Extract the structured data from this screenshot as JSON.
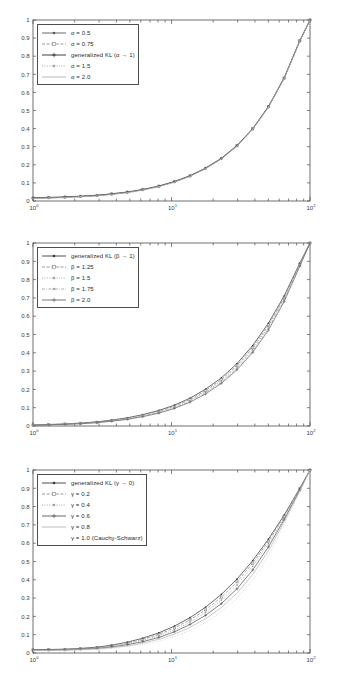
{
  "figure": {
    "background": "#ffffff",
    "axis_color": "#4d4d4d",
    "text_color": "#3a3a3a"
  },
  "chart_data": [
    {
      "type": "line",
      "title": "",
      "xlabel": "",
      "ylabel": "",
      "xscale": "log",
      "xlim": [
        1,
        100
      ],
      "ylim": [
        0,
        1
      ],
      "grid": false,
      "legend_position": "upper left",
      "xtick_labels": [
        "10^0",
        "10^1",
        "10^2"
      ],
      "xtick_values": [
        1,
        10,
        100
      ],
      "ytick_labels": [
        "0",
        "0.1",
        "0.2",
        "0.3",
        "0.4",
        "0.5",
        "0.6",
        "0.7",
        "0.8",
        "0.9",
        "1"
      ],
      "ytick_values": [
        0,
        0.1,
        0.2,
        0.3,
        0.4,
        0.5,
        0.6,
        0.7,
        0.8,
        0.9,
        1
      ],
      "x": [
        1,
        1.3,
        1.7,
        2.2,
        2.9,
        3.7,
        4.8,
        6.2,
        8.1,
        10.5,
        13.6,
        17.6,
        22.9,
        29.7,
        38.6,
        50.1,
        65.0,
        84.4,
        100
      ],
      "series": [
        {
          "name": "α = 0.5",
          "marker": "dot",
          "dash": "solid",
          "color": "#5a5a5a",
          "values": [
            0.018,
            0.02,
            0.023,
            0.027,
            0.032,
            0.04,
            0.05,
            0.064,
            0.083,
            0.108,
            0.14,
            0.182,
            0.236,
            0.307,
            0.4,
            0.522,
            0.68,
            0.886,
            1.0
          ]
        },
        {
          "name": "α = 0.75",
          "marker": "square",
          "dash": "dashed",
          "color": "#8c8c8c",
          "values": [
            0.017,
            0.019,
            0.022,
            0.026,
            0.031,
            0.039,
            0.049,
            0.063,
            0.082,
            0.107,
            0.139,
            0.181,
            0.235,
            0.306,
            0.399,
            0.521,
            0.679,
            0.885,
            1.0
          ]
        },
        {
          "name": "generalized KL (α → 1)",
          "marker": "plus",
          "dash": "solid",
          "color": "#2b2b2b",
          "values": [
            0.016,
            0.018,
            0.021,
            0.025,
            0.03,
            0.038,
            0.048,
            0.062,
            0.081,
            0.106,
            0.138,
            0.18,
            0.234,
            0.305,
            0.398,
            0.52,
            0.678,
            0.884,
            1.0
          ]
        },
        {
          "name": "α = 1.5",
          "marker": "dot",
          "dash": "dotted",
          "color": "#9e9e9e",
          "values": [
            0.015,
            0.017,
            0.02,
            0.024,
            0.029,
            0.037,
            0.047,
            0.061,
            0.08,
            0.105,
            0.137,
            0.179,
            0.233,
            0.304,
            0.397,
            0.519,
            0.677,
            0.883,
            1.0
          ]
        },
        {
          "name": "α = 2.0",
          "marker": "none",
          "dash": "solid",
          "color": "#b0b0b0",
          "values": [
            0.014,
            0.016,
            0.019,
            0.023,
            0.028,
            0.036,
            0.046,
            0.06,
            0.079,
            0.104,
            0.136,
            0.178,
            0.232,
            0.303,
            0.396,
            0.518,
            0.676,
            0.882,
            1.0
          ]
        }
      ]
    },
    {
      "type": "line",
      "title": "",
      "xlabel": "",
      "ylabel": "",
      "xscale": "log",
      "xlim": [
        1,
        100
      ],
      "ylim": [
        0,
        1
      ],
      "grid": false,
      "legend_position": "upper left",
      "xtick_labels": [
        "10^0",
        "10^1",
        "10^2"
      ],
      "xtick_values": [
        1,
        10,
        100
      ],
      "ytick_labels": [
        "0",
        "0.1",
        "0.2",
        "0.3",
        "0.4",
        "0.5",
        "0.6",
        "0.7",
        "0.8",
        "0.9",
        "1"
      ],
      "ytick_values": [
        0,
        0.1,
        0.2,
        0.3,
        0.4,
        0.5,
        0.6,
        0.7,
        0.8,
        0.9,
        1
      ],
      "x": [
        1,
        1.3,
        1.7,
        2.2,
        2.9,
        3.7,
        4.8,
        6.2,
        8.1,
        10.5,
        13.6,
        17.6,
        22.9,
        29.7,
        38.6,
        50.1,
        65.0,
        84.4,
        100
      ],
      "series": [
        {
          "name": "generalized KL (β → 1)",
          "marker": "dot",
          "dash": "solid",
          "color": "#3a3a3a",
          "values": [
            0.006,
            0.008,
            0.011,
            0.016,
            0.023,
            0.032,
            0.045,
            0.062,
            0.085,
            0.114,
            0.152,
            0.201,
            0.263,
            0.341,
            0.44,
            0.562,
            0.71,
            0.89,
            1.0
          ]
        },
        {
          "name": "β = 1.25",
          "marker": "square",
          "dash": "dashed",
          "color": "#8c8c8c",
          "values": [
            0.006,
            0.008,
            0.011,
            0.015,
            0.021,
            0.03,
            0.042,
            0.058,
            0.08,
            0.108,
            0.145,
            0.193,
            0.254,
            0.331,
            0.429,
            0.551,
            0.7,
            0.884,
            1.0
          ]
        },
        {
          "name": "β = 1.5",
          "marker": "dot",
          "dash": "dotted",
          "color": "#9e9e9e",
          "values": [
            0.005,
            0.007,
            0.01,
            0.014,
            0.02,
            0.028,
            0.04,
            0.055,
            0.076,
            0.103,
            0.139,
            0.186,
            0.246,
            0.322,
            0.419,
            0.541,
            0.692,
            0.88,
            1.0
          ]
        },
        {
          "name": "β = 1.75",
          "marker": "dot",
          "dash": "dashdot",
          "color": "#a8a8a8",
          "values": [
            0.005,
            0.007,
            0.009,
            0.013,
            0.019,
            0.027,
            0.038,
            0.053,
            0.073,
            0.099,
            0.134,
            0.18,
            0.239,
            0.314,
            0.41,
            0.532,
            0.685,
            0.876,
            1.0
          ]
        },
        {
          "name": "β = 2.0",
          "marker": "plus",
          "dash": "solid",
          "color": "#6e6e6e",
          "values": [
            0.004,
            0.006,
            0.009,
            0.012,
            0.018,
            0.026,
            0.036,
            0.051,
            0.07,
            0.096,
            0.13,
            0.175,
            0.233,
            0.307,
            0.402,
            0.524,
            0.679,
            0.873,
            1.0
          ]
        }
      ]
    },
    {
      "type": "line",
      "title": "",
      "xlabel": "",
      "ylabel": "",
      "xscale": "log",
      "xlim": [
        1,
        100
      ],
      "ylim": [
        0,
        1
      ],
      "grid": false,
      "legend_position": "upper left",
      "xtick_labels": [
        "10^0",
        "10^1",
        "10^2"
      ],
      "xtick_values": [
        1,
        10,
        100
      ],
      "ytick_labels": [
        "0",
        "0.1",
        "0.2",
        "0.3",
        "0.4",
        "0.5",
        "0.6",
        "0.7",
        "0.8",
        "0.9",
        "1"
      ],
      "ytick_values": [
        0,
        0.1,
        0.2,
        0.3,
        0.4,
        0.5,
        0.6,
        0.7,
        0.8,
        0.9,
        1
      ],
      "x": [
        1,
        1.3,
        1.7,
        2.2,
        2.9,
        3.7,
        4.8,
        6.2,
        8.1,
        10.5,
        13.6,
        17.6,
        22.9,
        29.7,
        38.6,
        50.1,
        65.0,
        84.4,
        100
      ],
      "series": [
        {
          "name": "generalized KL (γ → 0)",
          "marker": "dot",
          "dash": "solid",
          "color": "#3a3a3a",
          "values": [
            0.018,
            0.019,
            0.021,
            0.025,
            0.032,
            0.043,
            0.059,
            0.081,
            0.11,
            0.147,
            0.193,
            0.25,
            0.32,
            0.404,
            0.505,
            0.622,
            0.753,
            0.9,
            1.0
          ]
        },
        {
          "name": "γ = 0.2",
          "marker": "square",
          "dash": "dashed",
          "color": "#8c8c8c",
          "values": [
            0.017,
            0.018,
            0.02,
            0.024,
            0.03,
            0.04,
            0.055,
            0.075,
            0.102,
            0.137,
            0.181,
            0.236,
            0.305,
            0.389,
            0.491,
            0.611,
            0.746,
            0.897,
            1.0
          ]
        },
        {
          "name": "γ = 0.4",
          "marker": "dot",
          "dash": "dotted",
          "color": "#9e9e9e",
          "values": [
            0.016,
            0.017,
            0.019,
            0.022,
            0.028,
            0.037,
            0.05,
            0.069,
            0.094,
            0.127,
            0.169,
            0.222,
            0.289,
            0.372,
            0.474,
            0.597,
            0.738,
            0.894,
            1.0
          ]
        },
        {
          "name": "γ = 0.6",
          "marker": "plus",
          "dash": "solid",
          "color": "#5a5a5a",
          "values": [
            0.015,
            0.016,
            0.017,
            0.02,
            0.025,
            0.033,
            0.045,
            0.062,
            0.085,
            0.116,
            0.156,
            0.206,
            0.27,
            0.351,
            0.454,
            0.58,
            0.728,
            0.89,
            1.0
          ]
        },
        {
          "name": "γ = 0.8",
          "marker": "none",
          "dash": "solid",
          "color": "#b5b5b5",
          "values": [
            0.014,
            0.014,
            0.016,
            0.018,
            0.022,
            0.029,
            0.039,
            0.054,
            0.075,
            0.103,
            0.14,
            0.187,
            0.248,
            0.327,
            0.429,
            0.559,
            0.716,
            0.886,
            1.0
          ]
        },
        {
          "name": "γ = 1.0 (Cauchy-Schwarz)",
          "marker": "none",
          "dash": "none",
          "color": "#c8c8c8",
          "values": [
            0.012,
            0.013,
            0.014,
            0.016,
            0.019,
            0.025,
            0.034,
            0.047,
            0.065,
            0.09,
            0.124,
            0.167,
            0.224,
            0.299,
            0.399,
            0.532,
            0.699,
            0.88,
            1.0
          ]
        }
      ]
    }
  ]
}
